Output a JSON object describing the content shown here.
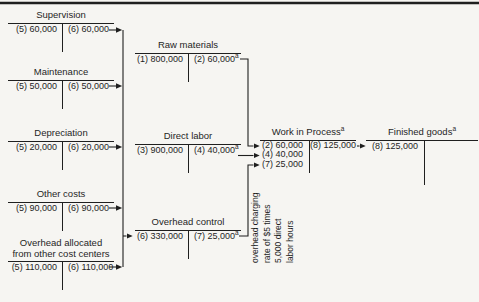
{
  "colors": {
    "bg": "#f6f5f2",
    "ink": "#1f1f1f"
  },
  "footnote_marker": "a",
  "accounts": {
    "supervision": {
      "title": "Supervision",
      "debit": "(5) 60,000",
      "credit": "(6) 60,000"
    },
    "maintenance": {
      "title": "Maintenance",
      "debit": "(5) 50,000",
      "credit": "(6) 50,000"
    },
    "depreciation": {
      "title": "Depreciation",
      "debit": "(5) 20,000",
      "credit": "(6) 20,000"
    },
    "other_costs": {
      "title": "Other costs",
      "debit": "(5) 90,000",
      "credit": "(6) 90,000"
    },
    "overhead_allocated": {
      "title_line1": "Overhead allocated",
      "title_line2": "from other cost centers",
      "debit": "(5) 110,000",
      "credit": "(6) 110,000"
    },
    "raw_materials": {
      "title": "Raw materials",
      "debit": "(1) 800,000",
      "credit": "(2) 60,000",
      "credit_superscript": "a"
    },
    "direct_labor": {
      "title": "Direct labor",
      "debit": "(3) 900,000",
      "credit": "(4) 40,000",
      "credit_superscript": "a"
    },
    "overhead_control": {
      "title": "Overhead control",
      "debit": "(6) 330,000",
      "credit": "(7) 25,000",
      "credit_superscript": "a"
    },
    "work_in_process": {
      "title": "Work in Process",
      "title_superscript": "a",
      "debits": [
        "(2) 60,000",
        "(4) 40,000",
        "(7) 25,000"
      ],
      "credit": "(8) 125,000"
    },
    "finished_goods": {
      "title": "Finished goods",
      "title_superscript": "a",
      "debit": "(8) 125,000"
    }
  },
  "annotation": {
    "lines": [
      "overhead charging",
      "rate of $5 times",
      "5,000 direct",
      "labor hours"
    ]
  },
  "flows": [
    "supervision -> overhead control",
    "maintenance -> overhead control",
    "depreciation -> overhead control",
    "other costs -> overhead control",
    "overhead allocated from other cost centers -> overhead control",
    "raw materials -> work in process",
    "direct labor -> work in process",
    "overhead control -> work in process",
    "work in process -> finished goods"
  ]
}
